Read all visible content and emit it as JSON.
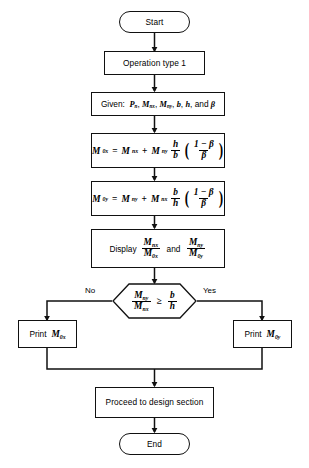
{
  "diagram": {
    "type": "flowchart",
    "colors": {
      "stroke": "#111111",
      "background": "#ffffff",
      "text": "#000000"
    },
    "nodes": {
      "start": {
        "shape": "terminator",
        "label": "Start"
      },
      "operation": {
        "shape": "process",
        "label": "Operation type 1"
      },
      "given": {
        "shape": "process",
        "label_prefix": "Given:",
        "variables": "P_n, M_nx, M_ny, b, h, and β"
      },
      "eq_mox": {
        "shape": "process",
        "equation": "M_0x = M_nx + M_ny (h/b)((1-β)/β)"
      },
      "eq_moy": {
        "shape": "process",
        "equation": "M_0y = M_ny + M_nx (b/h)((1-β)/β)"
      },
      "display": {
        "shape": "process",
        "label_prefix": "Display",
        "ratio_1": "M_nx/M_0x",
        "conjunction": "and",
        "ratio_2": "M_ny/M_0y"
      },
      "decision": {
        "shape": "hexagon",
        "condition": "M_ny/M_nx ≥ b/h"
      },
      "print_left": {
        "shape": "process",
        "label_prefix": "Print",
        "value": "M_0x"
      },
      "print_right": {
        "shape": "process",
        "label_prefix": "Print",
        "value": "M_0y"
      },
      "proceed": {
        "shape": "process",
        "label": "Proceed to design section"
      },
      "end": {
        "shape": "terminator",
        "label": "End"
      }
    },
    "branches": {
      "no_label": "No",
      "yes_label": "Yes"
    },
    "symbols": {
      "M": "M",
      "P": "P",
      "b": "b",
      "h": "h",
      "beta": "β",
      "sub_n": "n",
      "sub_nx": "nx",
      "sub_ny": "ny",
      "sub_0x": "0x",
      "sub_0y": "0y",
      "one": "1",
      "minus": "−",
      "plus": "+",
      "equals": "=",
      "geq": "≥",
      "comma": ",",
      "colon": ":",
      "and_word": "and"
    }
  }
}
